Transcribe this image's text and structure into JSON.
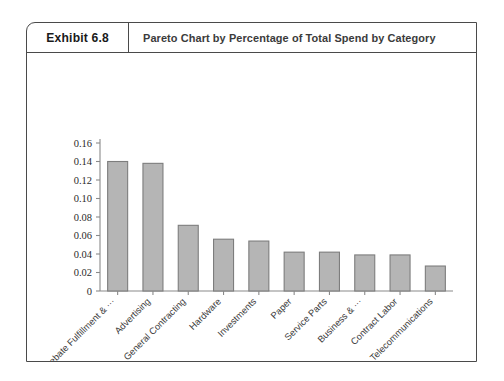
{
  "exhibit": {
    "number_label": "Exhibit 6.8",
    "title": "Pareto Chart by Percentage of Total Spend by Category"
  },
  "chart_data": {
    "type": "bar",
    "title": "Pareto Chart by Percentage of Total Spend by Category",
    "xlabel": "",
    "ylabel": "",
    "ylim": [
      0,
      0.16
    ],
    "grid": false,
    "legend": "none",
    "ytick_labels": [
      "0.16",
      "0.14",
      "0.12",
      "0.10",
      "0.08",
      "0.06",
      "0.04",
      "0.02",
      "0"
    ],
    "ytick_values": [
      0.16,
      0.14,
      0.12,
      0.1,
      0.08,
      0.06,
      0.04,
      0.02,
      0
    ],
    "categories": [
      "Rebate Fulfillment & ···",
      "Advertising",
      "General Contracting",
      "Hardware",
      "Investments",
      "Paper",
      "Service Parts",
      "Business & ···",
      "Contract Labor",
      "Telecommunications"
    ],
    "values": [
      0.14,
      0.138,
      0.071,
      0.056,
      0.054,
      0.042,
      0.042,
      0.039,
      0.039,
      0.027
    ],
    "bar_fill": "#b5b5b5",
    "bar_stroke": "#7d7d7d",
    "axis_color": "#8a8a8a"
  }
}
